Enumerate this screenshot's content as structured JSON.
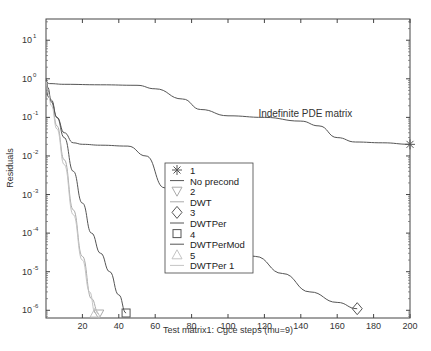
{
  "chart_data": {
    "type": "line",
    "title": "",
    "xlabel": "Test matrix1: Cgce steps (mu=9)",
    "ylabel": "Residuals",
    "xlim": [
      0,
      200
    ],
    "ylim_log10": [
      -6.2,
      1.55
    ],
    "yscale": "log",
    "grid": false,
    "x_ticks": [
      20,
      40,
      60,
      80,
      100,
      120,
      140,
      160,
      180,
      200
    ],
    "y_ticks": [
      {
        "exp": 1,
        "label": "10",
        "sup": "1"
      },
      {
        "exp": 0,
        "label": "10",
        "sup": "0"
      },
      {
        "exp": -1,
        "label": "10",
        "sup": "-1"
      },
      {
        "exp": -2,
        "label": "10",
        "sup": "-2"
      },
      {
        "exp": -3,
        "label": "10",
        "sup": "-3"
      },
      {
        "exp": -4,
        "label": "10",
        "sup": "-4"
      },
      {
        "exp": -5,
        "label": "10",
        "sup": "-5"
      },
      {
        "exp": -6,
        "label": "10",
        "sup": "-6"
      }
    ],
    "annotation": {
      "text": "Indefinite PDE matrix",
      "x": 148,
      "y": 0.11
    },
    "legend_position": "center",
    "series": [
      {
        "id": "1",
        "name": "No precond",
        "marker": "star",
        "color": "#555555",
        "end_marker": {
          "x": 200,
          "y": 0.02
        },
        "x": [
          0,
          2,
          10,
          30,
          50,
          60,
          75,
          85,
          100,
          120,
          140,
          150,
          160,
          170,
          185,
          200
        ],
        "y": [
          0.8,
          0.75,
          0.72,
          0.7,
          0.68,
          0.55,
          0.3,
          0.16,
          0.11,
          0.1,
          0.08,
          0.06,
          0.03,
          0.023,
          0.022,
          0.02
        ]
      },
      {
        "id": "2",
        "name": "DWT",
        "marker": "triangle-down",
        "color": "#aaaaaa",
        "end_marker": {
          "x": 29,
          "y": 8e-07
        },
        "x": [
          0,
          1,
          3,
          6,
          10,
          15,
          20,
          25,
          29
        ],
        "y": [
          0.9,
          0.5,
          0.25,
          0.06,
          0.008,
          0.0004,
          2.5e-05,
          2e-06,
          8e-07
        ]
      },
      {
        "id": "3",
        "name": "DWTPer",
        "marker": "diamond",
        "color": "#555555",
        "end_marker": {
          "x": 171,
          "y": 1.1e-06
        },
        "x": [
          0,
          1,
          3,
          6,
          10,
          15,
          20,
          30,
          45,
          55,
          65,
          75,
          85,
          100,
          115,
          130,
          145,
          160,
          171
        ],
        "y": [
          1.0,
          0.6,
          0.25,
          0.1,
          0.04,
          0.022,
          0.02,
          0.019,
          0.018,
          0.01,
          0.0015,
          0.00045,
          0.0002,
          5e-05,
          2.5e-05,
          9e-06,
          3e-06,
          1.6e-06,
          1.1e-06
        ]
      },
      {
        "id": "4",
        "name": "DWTPerMod",
        "marker": "square",
        "color": "#555555",
        "end_marker": {
          "x": 44,
          "y": 8.5e-07
        },
        "x": [
          0,
          1,
          3,
          6,
          10,
          15,
          20,
          25,
          30,
          35,
          40,
          44
        ],
        "y": [
          0.9,
          0.35,
          0.28,
          0.1,
          0.03,
          0.004,
          0.0006,
          0.0001,
          3e-05,
          1e-05,
          2.5e-06,
          8.5e-07
        ]
      },
      {
        "id": "5",
        "name": "DWTPer 1",
        "marker": "triangle-up",
        "color": "#c4c4c4",
        "end_marker": {
          "x": 27,
          "y": 8.5e-07
        },
        "x": [
          0,
          1,
          3,
          6,
          10,
          15,
          20,
          24,
          27
        ],
        "y": [
          0.85,
          0.45,
          0.2,
          0.05,
          0.006,
          0.0003,
          2e-05,
          3e-06,
          8.5e-07
        ]
      }
    ]
  },
  "legend": {
    "entries": [
      {
        "marker_label": "1",
        "line_label": "No precond"
      },
      {
        "marker_label": "2",
        "line_label": "DWT"
      },
      {
        "marker_label": "3",
        "line_label": "DWTPer"
      },
      {
        "marker_label": "4",
        "line_label": "DWTPerMod"
      },
      {
        "marker_label": "5",
        "line_label": "DWTPer 1"
      }
    ]
  }
}
